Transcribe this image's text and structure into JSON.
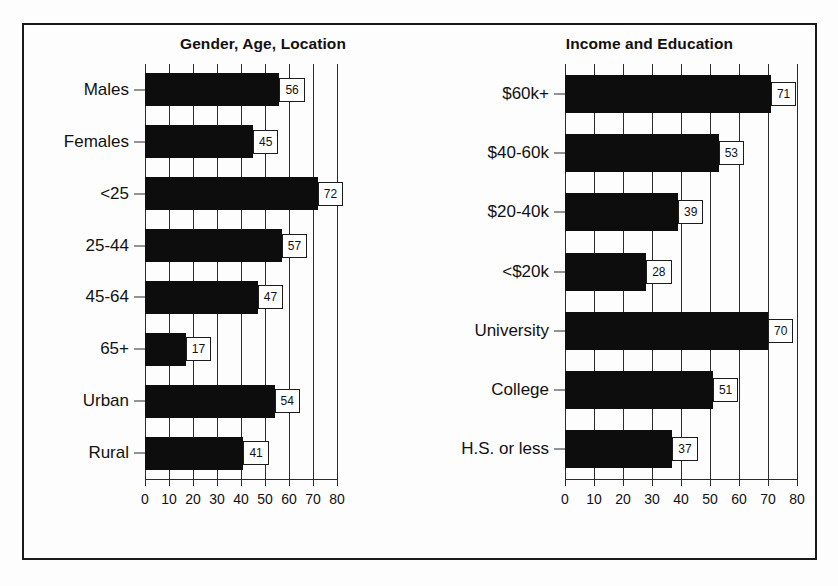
{
  "figure": {
    "background_color": "#fdfdfd",
    "frame_color": "#1a1a1a",
    "bar_color": "#0d0d0d",
    "grid_color": "#2b2b2b"
  },
  "chart_data": [
    {
      "type": "bar",
      "orientation": "horizontal",
      "title": "Gender, Age, Location",
      "xlabel": "",
      "ylabel": "",
      "xlim": [
        0,
        80
      ],
      "xticks": [
        0,
        10,
        20,
        30,
        40,
        50,
        60,
        70,
        80
      ],
      "xtick_labels": [
        "0",
        "10",
        "20",
        "30",
        "40",
        "50",
        "60",
        "70",
        "80"
      ],
      "grid": "vertical",
      "legend": "none",
      "data_labels": true,
      "categories": [
        "Males",
        "Females",
        "<25",
        "25-44",
        "45-64",
        "65+",
        "Urban",
        "Rural"
      ],
      "values": [
        56,
        45,
        72,
        57,
        47,
        17,
        54,
        41
      ]
    },
    {
      "type": "bar",
      "orientation": "horizontal",
      "title": "Income and Education",
      "xlabel": "",
      "ylabel": "",
      "xlim": [
        0,
        80
      ],
      "xticks": [
        0,
        10,
        20,
        30,
        40,
        50,
        60,
        70,
        80
      ],
      "xtick_labels": [
        "0",
        "10",
        "20",
        "30",
        "40",
        "50",
        "60",
        "70",
        "80"
      ],
      "grid": "vertical",
      "legend": "none",
      "data_labels": true,
      "categories": [
        "$60k+",
        "$40-60k",
        "$20-40k",
        "<$20k",
        "University",
        "College",
        "H.S. or less"
      ],
      "values": [
        71,
        53,
        39,
        28,
        70,
        51,
        37
      ]
    }
  ]
}
